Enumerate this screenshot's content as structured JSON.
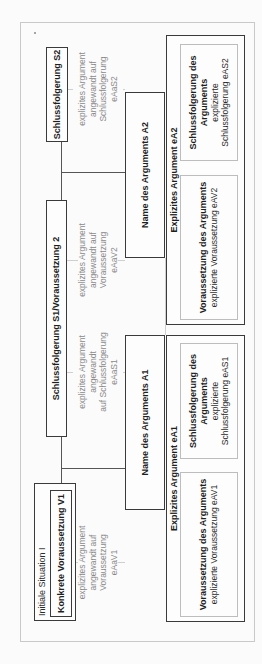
{
  "diagram": {
    "situation": {
      "label": "Initiale Situation I",
      "premise": "Konkrete Voraussetzung V1"
    },
    "nodes": {
      "s1v2": "Schlussfolgerung S1/Voraussetzung 2",
      "s2": "Schlussfolgerung S2"
    },
    "edge_labels": {
      "eAaV1": [
        "explizites Argument",
        "angewandt auf Voraussetzung",
        "eAaV1"
      ],
      "eAaS1": [
        "explizites Argument",
        "angewandt",
        "auf Schlussfolgerung",
        "eAaS1"
      ],
      "eAaV2": [
        "explizites Argument",
        "angewandt auf Voraussetzung",
        "eAaV2"
      ],
      "eAaS2": [
        "explizites Argument",
        "angewandt auf",
        "Schlussfolgerung",
        "eAaS2"
      ]
    },
    "arguments": {
      "a1": {
        "name": "Name des Arguments A1"
      },
      "a2": {
        "name": "Name des Arguments A2"
      }
    },
    "explicit_arguments": {
      "ea1": {
        "title": "Explizites Argument eA1",
        "premise_title": "Voraussetzung des Arguments",
        "premise_value": "explizierte Voraussetzung eAV1",
        "conclusion_title": [
          "Schlussfolgerung des",
          "Arguments"
        ],
        "conclusion_value": [
          "explizierte",
          "Schlussfolgerung eAS1"
        ]
      },
      "ea2": {
        "title": "Explizites Argument eA2",
        "premise_title": "Voraussetzung des Arguments",
        "premise_value": "explizierte Voraussetzung eAV2",
        "conclusion_title": [
          "Schlussfolgerung des",
          "Arguments"
        ],
        "conclusion_value": [
          "explizierte",
          "Schlussfolgerung eAS2"
        ]
      }
    }
  }
}
